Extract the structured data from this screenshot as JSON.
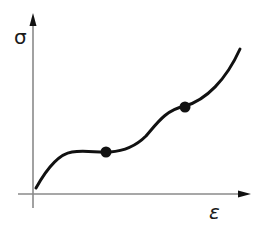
{
  "diagram": {
    "type": "stress-strain curve",
    "y_axis": {
      "label": "σ",
      "color": "#8a8a8a"
    },
    "x_axis": {
      "label": "ε",
      "color": "#8a8a8a"
    },
    "curve": {
      "color": "#111111",
      "description": "Rises steeply from origin, levels into a plateau, then rises through an inflection and curves upward steeply"
    },
    "points": [
      {
        "name": "plateau-point",
        "x": 106,
        "y": 152
      },
      {
        "name": "upper-inflection-point",
        "x": 185,
        "y": 107
      }
    ]
  }
}
